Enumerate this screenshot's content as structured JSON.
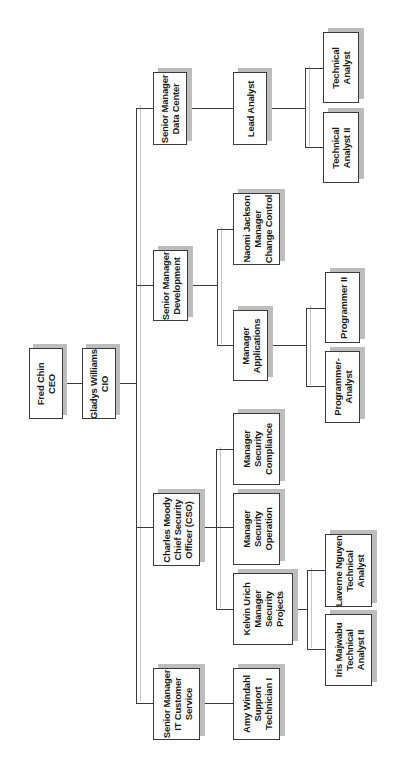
{
  "chart_title": "IT Department Organizational Chart",
  "orientation": "rotated -90 degrees",
  "colors": {
    "box_border": "#3a3a3a",
    "box_fill": "#ffffff",
    "shadow": "#bdbdbd",
    "connector": "#3a3a3a",
    "background": "#ffffff"
  },
  "nodes": {
    "ceo": {
      "lines": [
        "Fred Chin",
        "CEO"
      ]
    },
    "cio": {
      "lines": [
        "Gladys Williams",
        "CIO"
      ]
    },
    "sm_data_center": {
      "lines": [
        "Senior Manager",
        "Data Center"
      ]
    },
    "lead_analyst": {
      "lines": [
        "Lead Analyst"
      ]
    },
    "technical_analyst": {
      "lines": [
        "Technical",
        "Analyst"
      ]
    },
    "technical_analyst_ii": {
      "lines": [
        "Technical",
        "Analyst II"
      ]
    },
    "sm_development": {
      "lines": [
        "Senior Manager",
        "Development"
      ]
    },
    "naomi_jackson": {
      "lines": [
        "Naomi Jackson",
        "Manager",
        "Change Control"
      ]
    },
    "manager_applications": {
      "lines": [
        "Manager",
        "Applications"
      ]
    },
    "programmer_ii": {
      "lines": [
        "Programmer II"
      ]
    },
    "programmer_analyst": {
      "lines": [
        "Programmer-",
        "Analyst"
      ]
    },
    "charles_moody": {
      "lines": [
        "Charles Moody",
        "Chief Security",
        "Officer (CSO)"
      ]
    },
    "mgr_security_compliance": {
      "lines": [
        "Manager",
        "Security",
        "Compliance"
      ]
    },
    "mgr_security_operation": {
      "lines": [
        "Manager",
        "Security",
        "Operation"
      ]
    },
    "kelvin_urich": {
      "lines": [
        "Kelvin Urich",
        "Manager",
        "Security",
        "Projects"
      ]
    },
    "laverne_nguyen": {
      "lines": [
        "Laverne Nguyen",
        "Technical",
        "Analyst"
      ]
    },
    "iris_majwabu": {
      "lines": [
        "Iris Majwabu",
        "Technical",
        "Analyst II"
      ]
    },
    "sm_it_customer_service": {
      "lines": [
        "Senior Manager",
        "IT Customer",
        "Service"
      ]
    },
    "amy_windahl": {
      "lines": [
        "Amy Windahl",
        "Support",
        "Technician I"
      ]
    }
  },
  "hierarchy": [
    {
      "name": "Fred Chin",
      "title": "CEO",
      "children": [
        {
          "name": "Gladys Williams",
          "title": "CIO",
          "children": [
            {
              "title": "Senior Manager Data Center",
              "children": [
                {
                  "title": "Lead Analyst",
                  "children": [
                    {
                      "title": "Technical Analyst"
                    },
                    {
                      "title": "Technical Analyst II"
                    }
                  ]
                }
              ]
            },
            {
              "title": "Senior Manager Development",
              "children": [
                {
                  "name": "Naomi Jackson",
                  "title": "Manager Change Control"
                },
                {
                  "title": "Manager Applications",
                  "children": [
                    {
                      "title": "Programmer II"
                    },
                    {
                      "title": "Programmer-Analyst"
                    }
                  ]
                }
              ]
            },
            {
              "name": "Charles Moody",
              "title": "Chief Security Officer (CSO)",
              "children": [
                {
                  "title": "Manager Security Compliance"
                },
                {
                  "title": "Manager Security Operation"
                },
                {
                  "name": "Kelvin Urich",
                  "title": "Manager Security Projects",
                  "children": [
                    {
                      "name": "Laverne Nguyen",
                      "title": "Technical Analyst"
                    },
                    {
                      "name": "Iris Majwabu",
                      "title": "Technical Analyst II"
                    }
                  ]
                }
              ]
            },
            {
              "title": "Senior Manager IT Customer Service",
              "children": [
                {
                  "name": "Amy Windahl",
                  "title": "Support Technician I"
                }
              ]
            }
          ]
        }
      ]
    }
  ]
}
